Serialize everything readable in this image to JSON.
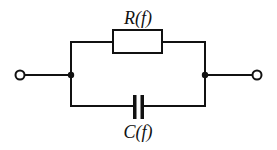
{
  "diagram": {
    "type": "circuit",
    "components": [
      {
        "id": "resistor",
        "kind": "resistor",
        "label": "R(f)",
        "branch": "top"
      },
      {
        "id": "capacitor",
        "kind": "capacitor",
        "label": "C(f)",
        "branch": "bottom"
      }
    ],
    "terminals": [
      {
        "id": "left-terminal",
        "side": "left"
      },
      {
        "id": "right-terminal",
        "side": "right"
      }
    ],
    "junctions": [
      {
        "id": "left-junction"
      },
      {
        "id": "right-junction"
      }
    ],
    "connection": "R(f) in parallel with C(f) between two terminals"
  },
  "labels": {
    "resistor": "R(f)",
    "capacitor": "C(f)"
  },
  "colors": {
    "stroke": "#111111",
    "background": "#ffffff"
  }
}
